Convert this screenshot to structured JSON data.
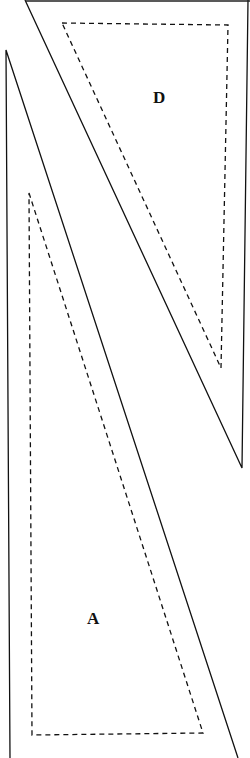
{
  "pieces": [
    {
      "id": "D",
      "label": "D",
      "label_pos": [
        153,
        88
      ],
      "outline": [
        [
          25,
          0
        ],
        [
          248,
          0
        ],
        [
          242,
          468
        ]
      ],
      "seam": [
        [
          62,
          23
        ],
        [
          228,
          25
        ],
        [
          221,
          368
        ]
      ]
    },
    {
      "id": "A",
      "label": "A",
      "label_pos": [
        88,
        610
      ],
      "outline": [
        [
          6,
          50
        ],
        [
          238,
          758
        ],
        [
          10,
          758
        ]
      ],
      "seam": [
        [
          29,
          193
        ],
        [
          203,
          733
        ],
        [
          32,
          735
        ]
      ]
    }
  ],
  "colors": {
    "line": "#111111",
    "background": "#ffffff"
  }
}
